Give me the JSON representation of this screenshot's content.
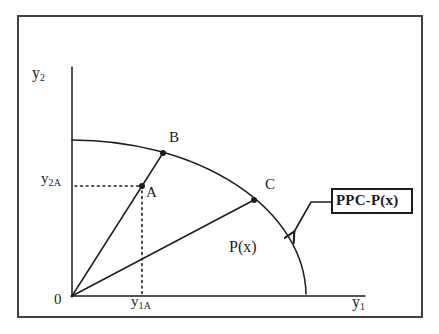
{
  "labels": {
    "y_axis": {
      "base": "y",
      "sub": "2"
    },
    "x_axis": {
      "base": "y",
      "sub": "1"
    },
    "origin": "0",
    "y_coord_a": {
      "base": "y",
      "sub": "2A"
    },
    "x_coord_a": {
      "base": "y",
      "sub": "1A"
    },
    "point_a": "A",
    "point_b": "B",
    "point_c": "C",
    "region": "P(x)",
    "callout": "PPC-P(x)"
  },
  "colors": {
    "ink": "#1c1c1c",
    "background": "#ffffff",
    "frame": "#414141"
  }
}
